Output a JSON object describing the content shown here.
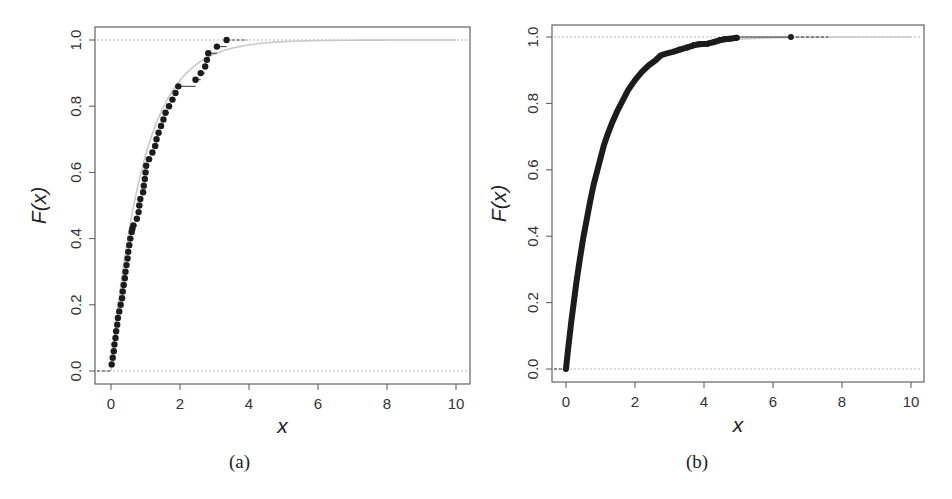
{
  "figure": {
    "panels": [
      {
        "id": "a",
        "caption": "(a)",
        "xlabel": "x",
        "ylabel": "F(x)",
        "xticks": [
          "0",
          "2",
          "4",
          "6",
          "8",
          "10"
        ],
        "yticks": [
          "0.0",
          "0.2",
          "0.4",
          "0.6",
          "0.8",
          "1.0"
        ]
      },
      {
        "id": "b",
        "caption": "(b)",
        "xlabel": "x",
        "ylabel": "F(x)",
        "xticks": [
          "0",
          "2",
          "4",
          "6",
          "8",
          "10"
        ],
        "yticks": [
          "0.0",
          "0.2",
          "0.4",
          "0.6",
          "0.8",
          "1.0"
        ]
      }
    ]
  },
  "colors": {
    "points": "#1c1c1c",
    "theoretical_curve": "#c9c9c9",
    "reference_lines": "#b5b5b5",
    "frame": "#555555"
  },
  "chart_data": [
    {
      "type": "scatter",
      "title": "(a)",
      "subtitle": "Empirical CDF (step function) of a small sample with theoretical exponential CDF overlay",
      "xlabel": "x",
      "ylabel": "F(x)",
      "xlim": [
        -0.3,
        10.3
      ],
      "ylim": [
        -0.04,
        1.04
      ],
      "xticks": [
        0,
        2,
        4,
        6,
        8,
        10
      ],
      "yticks": [
        0.0,
        0.2,
        0.4,
        0.6,
        0.8,
        1.0
      ],
      "grid": false,
      "reference_lines_y": [
        0,
        1
      ],
      "theoretical_curve": {
        "form": "1 - exp(-x/mean)",
        "mean": 0.95,
        "x_range": [
          0,
          10
        ],
        "color": "#c9c9c9"
      },
      "series": [
        {
          "name": "empirical CDF points",
          "x": [
            0.02,
            0.05,
            0.08,
            0.1,
            0.13,
            0.15,
            0.18,
            0.2,
            0.24,
            0.28,
            0.32,
            0.34,
            0.37,
            0.4,
            0.42,
            0.45,
            0.48,
            0.5,
            0.53,
            0.56,
            0.6,
            0.62,
            0.65,
            0.75,
            0.8,
            0.82,
            0.85,
            0.93,
            0.95,
            0.98,
            1.0,
            1.02,
            1.1,
            1.2,
            1.28,
            1.32,
            1.38,
            1.45,
            1.52,
            1.58,
            1.68,
            1.78,
            1.87,
            1.95,
            2.45,
            2.6,
            2.73,
            2.78,
            2.82,
            3.07,
            3.35
          ],
          "y": [
            0.02,
            0.04,
            0.06,
            0.08,
            0.1,
            0.12,
            0.14,
            0.16,
            0.18,
            0.2,
            0.22,
            0.24,
            0.26,
            0.28,
            0.3,
            0.32,
            0.34,
            0.36,
            0.38,
            0.4,
            0.42,
            0.43,
            0.44,
            0.46,
            0.48,
            0.5,
            0.52,
            0.54,
            0.56,
            0.58,
            0.6,
            0.62,
            0.64,
            0.66,
            0.68,
            0.7,
            0.72,
            0.74,
            0.76,
            0.78,
            0.8,
            0.82,
            0.84,
            0.86,
            0.88,
            0.9,
            0.92,
            0.94,
            0.96,
            0.98,
            1.0
          ]
        }
      ]
    },
    {
      "type": "scatter",
      "title": "(b)",
      "subtitle": "Empirical CDF of a large sample (points merge into a thick curve) with theoretical exponential CDF overlay",
      "xlabel": "x",
      "ylabel": "F(x)",
      "xlim": [
        -0.3,
        10.3
      ],
      "ylim": [
        -0.04,
        1.04
      ],
      "xticks": [
        0,
        2,
        4,
        6,
        8,
        10
      ],
      "yticks": [
        0.0,
        0.2,
        0.4,
        0.6,
        0.8,
        1.0
      ],
      "grid": false,
      "reference_lines_y": [
        0,
        1
      ],
      "theoretical_curve": {
        "form": "1 - exp(-x/mean)",
        "mean": 1.0,
        "x_range": [
          0,
          10
        ],
        "color": "#c9c9c9"
      },
      "series": [
        {
          "name": "empirical CDF (dense)",
          "x": [
            0.0,
            0.05,
            0.1,
            0.15,
            0.2,
            0.3,
            0.4,
            0.5,
            0.6,
            0.7,
            0.8,
            0.9,
            1.0,
            1.1,
            1.2,
            1.35,
            1.5,
            1.65,
            1.8,
            2.0,
            2.2,
            2.4,
            2.6,
            2.75,
            2.9,
            3.1,
            3.3,
            3.5,
            3.7,
            3.85,
            4.1,
            4.3,
            4.45,
            4.6,
            4.75,
            4.95,
            6.52
          ],
          "y": [
            0.0,
            0.05,
            0.095,
            0.14,
            0.18,
            0.26,
            0.33,
            0.395,
            0.45,
            0.505,
            0.555,
            0.595,
            0.635,
            0.675,
            0.705,
            0.745,
            0.78,
            0.81,
            0.84,
            0.87,
            0.895,
            0.915,
            0.93,
            0.945,
            0.95,
            0.955,
            0.962,
            0.968,
            0.975,
            0.978,
            0.98,
            0.985,
            0.99,
            0.993,
            0.995,
            0.998,
            1.0
          ]
        }
      ]
    }
  ]
}
